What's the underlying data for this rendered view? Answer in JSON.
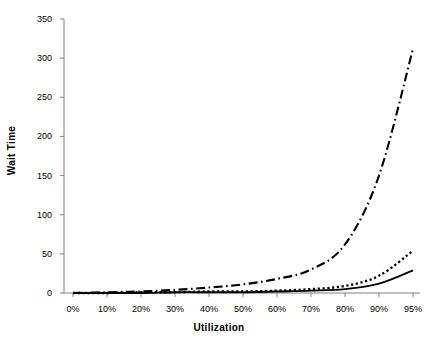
{
  "chart_data": {
    "type": "line",
    "title": "",
    "xlabel": "Utilization",
    "ylabel": "Wait Time",
    "categories": [
      "0%",
      "10%",
      "20%",
      "30%",
      "40%",
      "50%",
      "60%",
      "70%",
      "80%",
      "90%",
      "95%"
    ],
    "ylim": [
      0,
      350
    ],
    "yticks": [
      0,
      50,
      100,
      150,
      200,
      250,
      300,
      350
    ],
    "ytick_labels": [
      "0",
      "50",
      "100",
      "150",
      "200",
      "250",
      "300",
      "350"
    ],
    "grid": false,
    "legend": "none",
    "series": [
      {
        "name": "series-dash-dot",
        "style": "dash-dot",
        "values": [
          0,
          1,
          2,
          4,
          7,
          11,
          18,
          30,
          62,
          150,
          312
        ]
      },
      {
        "name": "series-dotted",
        "style": "dotted",
        "values": [
          0,
          0,
          1,
          1,
          2,
          2,
          3,
          5,
          9,
          22,
          54
        ]
      },
      {
        "name": "series-solid",
        "style": "solid",
        "values": [
          0,
          0,
          0,
          1,
          1,
          1,
          2,
          3,
          5,
          12,
          29
        ]
      }
    ],
    "colors": {
      "line": "#000000",
      "axis": "#808080",
      "background": "#ffffff"
    }
  }
}
